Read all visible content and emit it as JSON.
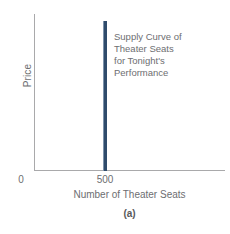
{
  "chart_data": {
    "type": "line",
    "title": "",
    "panel_label": "(a)",
    "xlabel": "Number of Theater Seats",
    "ylabel": "Price",
    "xticks": [
      "0",
      "500"
    ],
    "xtick_values": [
      0,
      500
    ],
    "yticks": [],
    "xlim": [
      0,
      1000
    ],
    "ylim": [
      0,
      100
    ],
    "grid": false,
    "legend": "none",
    "series": [
      {
        "name": "Supply Curve of Theater Seats for Tonight's Performance",
        "shape": "vertical-line",
        "x": 500,
        "y_from": 0,
        "y_to": 95,
        "color": "#2f4b6b",
        "description": "Perfectly inelastic supply: quantity fixed at 500 seats at every price"
      }
    ],
    "annotations": [
      {
        "lines": [
          "Supply Curve of",
          "Theater Seats",
          "for Tonight's",
          "Performance"
        ],
        "color": "#6d6e71"
      }
    ]
  },
  "axes": {
    "y_title": "Price",
    "x_title": "Number of Theater Seats",
    "tick_zero": "0",
    "tick_quantity": "500",
    "axis_color": "#a9a9ab"
  },
  "annotation": {
    "line1": "Supply Curve of",
    "line2": "Theater Seats",
    "line3": "for Tonight's",
    "line4": "Performance"
  },
  "figure": {
    "panel_label": "(a)"
  },
  "colors": {
    "supply_line": "#2f4b6b",
    "axis": "#a9a9ab",
    "text": "#6d6e71",
    "background": "#ffffff"
  }
}
